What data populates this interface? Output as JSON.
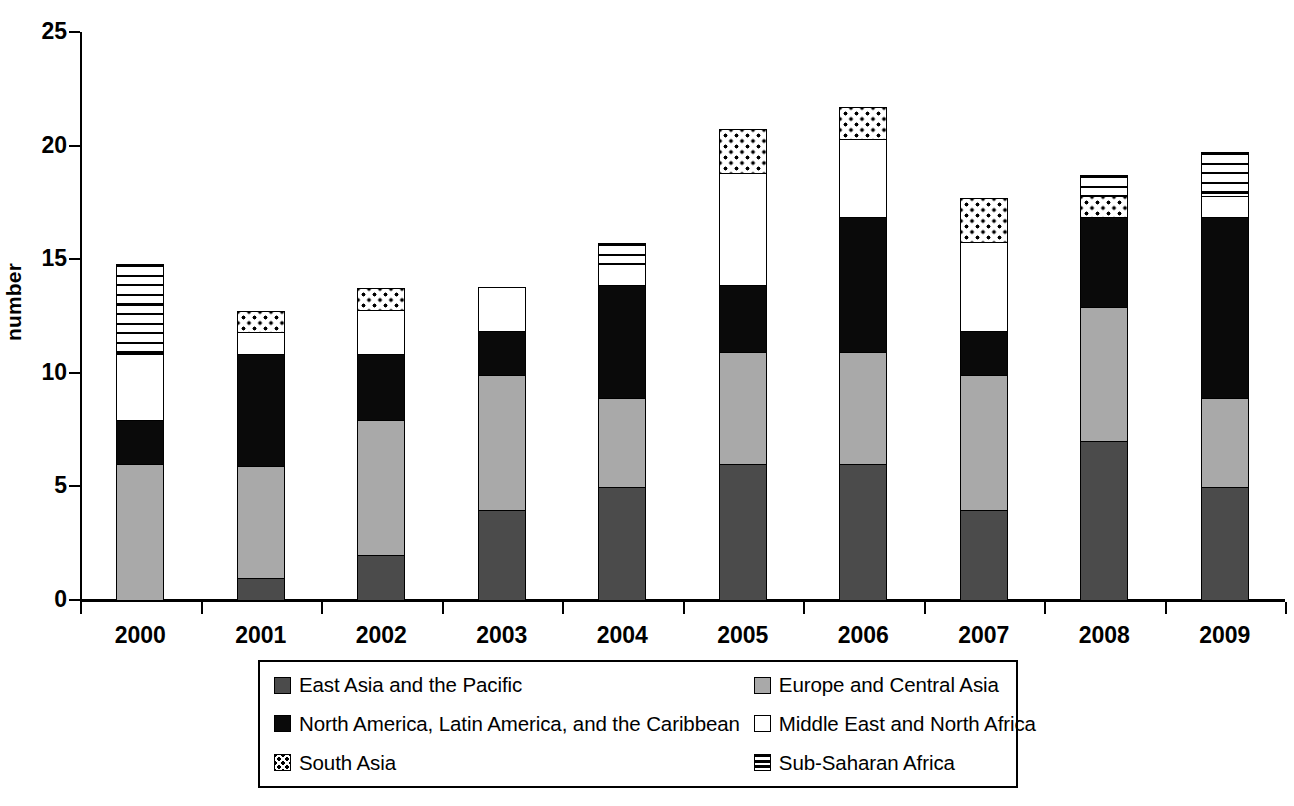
{
  "chart_data": {
    "type": "bar",
    "stacked": true,
    "title": "",
    "xlabel": "",
    "ylabel": "number",
    "ylim": [
      0,
      25
    ],
    "yticks": [
      0,
      5,
      10,
      15,
      20,
      25
    ],
    "grid": false,
    "legend_position": "bottom",
    "categories": [
      "2000",
      "2001",
      "2002",
      "2003",
      "2004",
      "2005",
      "2006",
      "2007",
      "2008",
      "2009"
    ],
    "series": [
      {
        "name": "East Asia and the Pacific",
        "key": "eap",
        "color": "#4b4b4b",
        "pattern": "solid-dark-gray",
        "values": [
          0,
          1,
          2,
          4,
          5,
          6,
          6,
          4,
          7,
          5
        ]
      },
      {
        "name": "Europe and Central Asia",
        "key": "eca",
        "color": "#a9a9a9",
        "pattern": "solid-light-gray",
        "values": [
          6,
          5,
          6,
          6,
          4,
          5,
          5,
          6,
          6,
          4
        ]
      },
      {
        "name": "North America, Latin America, and the Caribbean",
        "key": "nalac",
        "color": "#0a0a0a",
        "pattern": "solid-black",
        "values": [
          2,
          5,
          3,
          2,
          5,
          3,
          6,
          2,
          4,
          8
        ]
      },
      {
        "name": "Middle East and North Africa",
        "key": "mena",
        "color": "#ffffff",
        "pattern": "solid-white",
        "values": [
          3,
          1,
          2,
          2,
          1,
          5,
          3.5,
          4,
          0,
          1
        ]
      },
      {
        "name": "South Asia",
        "key": "sa",
        "color": "#ffffff",
        "pattern": "dotted",
        "values": [
          0,
          1,
          1,
          0,
          0,
          2,
          1.5,
          2,
          1,
          0
        ]
      },
      {
        "name": "Sub-Saharan Africa",
        "key": "ssa",
        "color": "#ffffff",
        "pattern": "horizontal-stripes",
        "values": [
          4,
          0,
          0,
          0,
          1,
          0,
          0,
          0,
          1,
          2
        ]
      }
    ],
    "totals": [
      15,
      13,
      14,
      14,
      16,
      21,
      22,
      18,
      19,
      20
    ]
  },
  "legend": {
    "items": [
      {
        "label": "East Asia and the Pacific",
        "key": "eap"
      },
      {
        "label": "Europe and Central Asia",
        "key": "eca"
      },
      {
        "label": "North America, Latin America, and the Caribbean",
        "key": "nalac"
      },
      {
        "label": "Middle East and North Africa",
        "key": "mena"
      },
      {
        "label": "South Asia",
        "key": "sa"
      },
      {
        "label": "Sub-Saharan Africa",
        "key": "ssa"
      }
    ]
  },
  "colors": {
    "east_asia": "#4b4b4b",
    "europe": "#a9a9a9",
    "north_america": "#0a0a0a",
    "middle_east": "#ffffff",
    "south_asia": "#ffffff",
    "sub_saharan": "#ffffff",
    "axis": "#000000",
    "background": "#ffffff"
  }
}
